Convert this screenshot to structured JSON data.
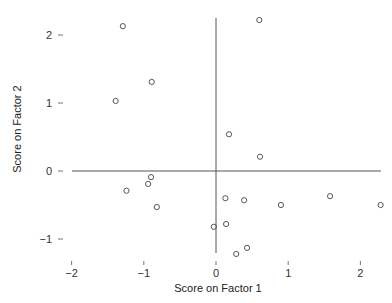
{
  "chart_data": {
    "type": "scatter",
    "title": "",
    "xlabel": "Score on Factor 1",
    "ylabel": "Score on Factor 2",
    "xlim": [
      -2.0,
      2.3
    ],
    "ylim": [
      -1.3,
      2.3
    ],
    "x_ticks": [
      -2,
      -1,
      0,
      1,
      2
    ],
    "y_ticks": [
      2,
      1,
      0,
      -1
    ],
    "x_tick_labels": [
      "−2",
      "−1",
      "0",
      "1",
      "2"
    ],
    "y_tick_labels": [
      "2",
      "1",
      "0",
      "−1"
    ],
    "grid": false,
    "legend": null,
    "reference_lines": {
      "horizontal_at_y": 0,
      "vertical_at_x": 0
    },
    "marker": "open-circle",
    "colors": {
      "marker": "#555555",
      "axis": "#555555",
      "text": "#333333"
    },
    "points": [
      {
        "x": -1.29,
        "y": 2.13
      },
      {
        "x": -0.89,
        "y": 1.31
      },
      {
        "x": -1.39,
        "y": 1.03
      },
      {
        "x": -0.9,
        "y": -0.09
      },
      {
        "x": -0.94,
        "y": -0.19
      },
      {
        "x": -1.24,
        "y": -0.29
      },
      {
        "x": -0.82,
        "y": -0.53
      },
      {
        "x": 0.6,
        "y": 2.22
      },
      {
        "x": 0.18,
        "y": 0.54
      },
      {
        "x": 0.61,
        "y": 0.21
      },
      {
        "x": 0.13,
        "y": -0.4
      },
      {
        "x": 0.39,
        "y": -0.43
      },
      {
        "x": -0.03,
        "y": -0.82
      },
      {
        "x": 0.14,
        "y": -0.78
      },
      {
        "x": 0.43,
        "y": -1.13
      },
      {
        "x": 0.28,
        "y": -1.22
      },
      {
        "x": 0.9,
        "y": -0.5
      },
      {
        "x": 1.58,
        "y": -0.37
      },
      {
        "x": 2.28,
        "y": -0.5
      }
    ]
  }
}
